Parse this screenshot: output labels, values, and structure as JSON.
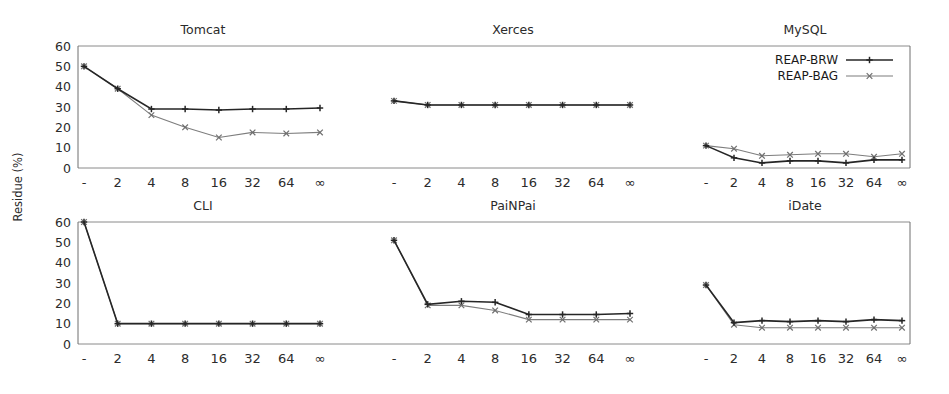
{
  "figure": {
    "ylabel": "Residue (%)",
    "legend": [
      {
        "label": "REAP-BRW",
        "marker": "plus-marker",
        "color": "#262626"
      },
      {
        "label": "REAP-BAG",
        "marker": "cross-marker",
        "color": "#7d7d7d"
      }
    ],
    "legend_position": "top-right of MySQL panel"
  },
  "chart_data": [
    {
      "type": "line",
      "title": "Tomcat",
      "xlabel": "",
      "ylabel": "Residue (%)",
      "categories": [
        "-",
        "2",
        "4",
        "8",
        "16",
        "32",
        "64",
        "∞"
      ],
      "ylim": [
        0,
        60
      ],
      "yticks": [
        0,
        10,
        20,
        30,
        40,
        50,
        60
      ],
      "grid": false,
      "series": [
        {
          "name": "REAP-BRW",
          "values": [
            50,
            39,
            29,
            29,
            28.5,
            29,
            29,
            29.5
          ]
        },
        {
          "name": "REAP-BAG",
          "values": [
            50,
            39,
            26,
            20,
            15,
            17.5,
            17,
            17.5
          ]
        }
      ]
    },
    {
      "type": "line",
      "title": "Xerces",
      "xlabel": "",
      "ylabel": "Residue (%)",
      "categories": [
        "-",
        "2",
        "4",
        "8",
        "16",
        "32",
        "64",
        "∞"
      ],
      "ylim": [
        0,
        60
      ],
      "yticks": [
        0,
        10,
        20,
        30,
        40,
        50,
        60
      ],
      "grid": false,
      "series": [
        {
          "name": "REAP-BRW",
          "values": [
            33,
            31,
            31,
            31,
            31,
            31,
            31,
            31
          ]
        },
        {
          "name": "REAP-BAG",
          "values": [
            33,
            31,
            31,
            31,
            31,
            31,
            31,
            31
          ]
        }
      ]
    },
    {
      "type": "line",
      "title": "MySQL",
      "xlabel": "",
      "ylabel": "Residue (%)",
      "categories": [
        "-",
        "2",
        "4",
        "8",
        "16",
        "32",
        "64",
        "∞"
      ],
      "ylim": [
        0,
        60
      ],
      "yticks": [
        0,
        10,
        20,
        30,
        40,
        50,
        60
      ],
      "grid": false,
      "series": [
        {
          "name": "REAP-BRW",
          "values": [
            11,
            5,
            2.5,
            3.5,
            3.5,
            2.5,
            4,
            4
          ]
        },
        {
          "name": "REAP-BAG",
          "values": [
            11,
            9.5,
            6,
            6.5,
            7,
            7,
            5.5,
            7
          ]
        }
      ]
    },
    {
      "type": "line",
      "title": "CLI",
      "xlabel": "",
      "ylabel": "Residue (%)",
      "categories": [
        "-",
        "2",
        "4",
        "8",
        "16",
        "32",
        "64",
        "∞"
      ],
      "ylim": [
        0,
        60
      ],
      "yticks": [
        0,
        10,
        20,
        30,
        40,
        50,
        60
      ],
      "grid": false,
      "series": [
        {
          "name": "REAP-BRW",
          "values": [
            60,
            10,
            10,
            10,
            10,
            10,
            10,
            10
          ]
        },
        {
          "name": "REAP-BAG",
          "values": [
            60,
            10,
            10,
            10,
            10,
            10,
            10,
            10
          ]
        }
      ]
    },
    {
      "type": "line",
      "title": "PaiNPai",
      "xlabel": "",
      "ylabel": "Residue (%)",
      "categories": [
        "-",
        "2",
        "4",
        "8",
        "16",
        "32",
        "64",
        "∞"
      ],
      "ylim": [
        0,
        60
      ],
      "yticks": [
        0,
        10,
        20,
        30,
        40,
        50,
        60
      ],
      "grid": false,
      "series": [
        {
          "name": "REAP-BRW",
          "values": [
            51,
            19.5,
            21,
            20.5,
            14.5,
            14.5,
            14.5,
            15
          ]
        },
        {
          "name": "REAP-BAG",
          "values": [
            51,
            19,
            19,
            16.5,
            12,
            12,
            12,
            12
          ]
        }
      ]
    },
    {
      "type": "line",
      "title": "iDate",
      "xlabel": "",
      "ylabel": "Residue (%)",
      "categories": [
        "-",
        "2",
        "4",
        "8",
        "16",
        "32",
        "64",
        "∞"
      ],
      "ylim": [
        0,
        60
      ],
      "yticks": [
        0,
        10,
        20,
        30,
        40,
        50,
        60
      ],
      "grid": false,
      "series": [
        {
          "name": "REAP-BRW",
          "values": [
            29,
            10.5,
            11.5,
            11,
            11.5,
            11,
            12,
            11.5
          ]
        },
        {
          "name": "REAP-BAG",
          "values": [
            29,
            9.5,
            8,
            8,
            8,
            8,
            8,
            8
          ]
        }
      ]
    }
  ]
}
